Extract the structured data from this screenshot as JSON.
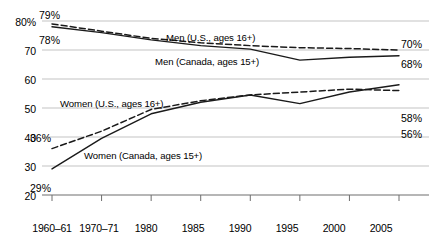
{
  "chart_data": {
    "type": "line",
    "title": "",
    "xlabel": "",
    "ylabel": "",
    "grid": true,
    "legend_position": "inline-labels",
    "ylim": [
      20,
      80
    ],
    "yticks": [
      20,
      30,
      40,
      50,
      60,
      70,
      80
    ],
    "ytick_labels": [
      "20",
      "30",
      "40",
      "50",
      "60",
      "70",
      "80%"
    ],
    "categories": [
      "1960–61",
      "1970–71",
      "1980",
      "1985",
      "1990",
      "1995",
      "2000",
      "2005"
    ],
    "series": [
      {
        "name": "Men (U.S., ages 16+)",
        "style": "dashed",
        "values": [
          79,
          76.5,
          74,
          72.5,
          71.5,
          70.8,
          70.5,
          70
        ],
        "start_value_label": "79%",
        "end_value_label": "70%"
      },
      {
        "name": "Men (Canada, ages 15+)",
        "style": "solid",
        "values": [
          78,
          76,
          73.5,
          71.5,
          70.3,
          66.5,
          67.5,
          68
        ],
        "start_value_label": "78%",
        "end_value_label": "68%"
      },
      {
        "name": "Women (U.S., ages 16+)",
        "style": "dashed",
        "values": [
          36,
          42,
          49.5,
          52.5,
          54.5,
          55.5,
          56.5,
          56
        ],
        "start_value_label": "36%",
        "end_value_label": "56%"
      },
      {
        "name": "Women (Canada, ages 15+)",
        "style": "solid",
        "values": [
          29,
          39.5,
          48,
          52,
          54.5,
          51.5,
          55.5,
          58
        ],
        "start_value_label": "29%",
        "end_value_label": "58%"
      }
    ],
    "annotations": {
      "men_us_label": "Men (U.S., ages 16+)",
      "men_canada_label": "Men (Canada, ages 15+)",
      "women_us_label": "Women (U.S., ages 16+)",
      "women_canada_label": "Women (Canada, ages 15+)"
    },
    "colors": {
      "line": "#1a1a1a",
      "grid": "#b4b4b4",
      "axis": "#6e6e6e",
      "background": "#ffffff"
    }
  }
}
